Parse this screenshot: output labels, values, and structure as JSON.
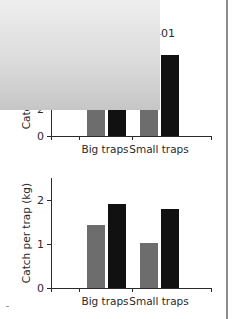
{
  "colors": {
    "series_1995": "#6d6d6d",
    "series_2000": "#111111",
    "axis": "#2a2a2a",
    "plot_bg_top": "#eeeeee",
    "plot_bg_bottom": "#c6c6c6",
    "gridline": "#ffffff",
    "border_rule": "#8c8c8c"
  },
  "legend": {
    "items": [
      {
        "label": "1995-96",
        "color": "#6d6d6d"
      },
      {
        "label": "2000-01",
        "color": "#111111"
      }
    ]
  },
  "chart_data": [
    {
      "type": "bar",
      "title": "",
      "xlabel": "",
      "ylabel": "Catch per trip (kg)",
      "categories": [
        "Big traps",
        "Small traps"
      ],
      "series": [
        {
          "name": "1995-96",
          "values": [
            4.6,
            3.1
          ]
        },
        {
          "name": "2000-01",
          "values": [
            6.7,
            5.9
          ]
        }
      ],
      "ylim": [
        0,
        8
      ],
      "yticks": [
        0,
        2,
        4,
        6,
        8
      ],
      "ytick_labels": [
        "0",
        "2",
        "4",
        "6",
        "8"
      ],
      "grid": true,
      "legend_position": "top-left inside plot"
    },
    {
      "type": "bar",
      "title": "",
      "xlabel": "",
      "ylabel": "Catch per trap (kg)",
      "categories": [
        "Big traps",
        "Small traps"
      ],
      "series": [
        {
          "name": "1995-96",
          "values": [
            1.44,
            1.03
          ]
        },
        {
          "name": "2000-01",
          "values": [
            1.91,
            1.8
          ]
        }
      ],
      "ylim": [
        0,
        2.5
      ],
      "yticks": [
        0,
        1,
        2
      ],
      "ytick_labels": [
        "0",
        "1",
        "2"
      ],
      "grid": true,
      "legend_position": "shared with top chart"
    }
  ]
}
